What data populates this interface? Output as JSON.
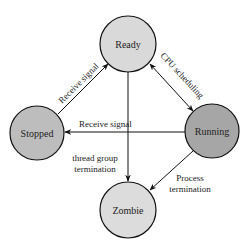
{
  "diagram": {
    "type": "state-transition",
    "nodes": [
      {
        "id": "ready",
        "label": "Ready",
        "cx": 128,
        "cy": 44,
        "r": 28,
        "fill": "#d9d9d9"
      },
      {
        "id": "stopped",
        "label": "Stopped",
        "cx": 37,
        "cy": 133,
        "r": 27,
        "fill": "#bdbdbd"
      },
      {
        "id": "running",
        "label": "Running",
        "cx": 212,
        "cy": 131,
        "r": 27,
        "fill": "#a6a6a6"
      },
      {
        "id": "zombie",
        "label": "Zombie",
        "cx": 128,
        "cy": 210,
        "r": 28,
        "fill": "#dcdcdc"
      }
    ],
    "edges": [
      {
        "id": "stopped-ready",
        "from": "stopped",
        "to": "ready",
        "label": "Receive signal",
        "bidirectional": false
      },
      {
        "id": "ready-running",
        "from": "ready",
        "to": "running",
        "label": "CPU scheduling",
        "bidirectional": true
      },
      {
        "id": "running-stopped",
        "from": "running",
        "to": "stopped",
        "label": "Receive signal",
        "bidirectional": false
      },
      {
        "id": "ready-zombie",
        "from": "ready",
        "to": "zombie",
        "label_lines": [
          "thread group",
          "termination"
        ],
        "bidirectional": false
      },
      {
        "id": "running-zombie",
        "from": "running",
        "to": "zombie",
        "label_lines": [
          "Process",
          "termination"
        ],
        "bidirectional": false
      }
    ]
  }
}
